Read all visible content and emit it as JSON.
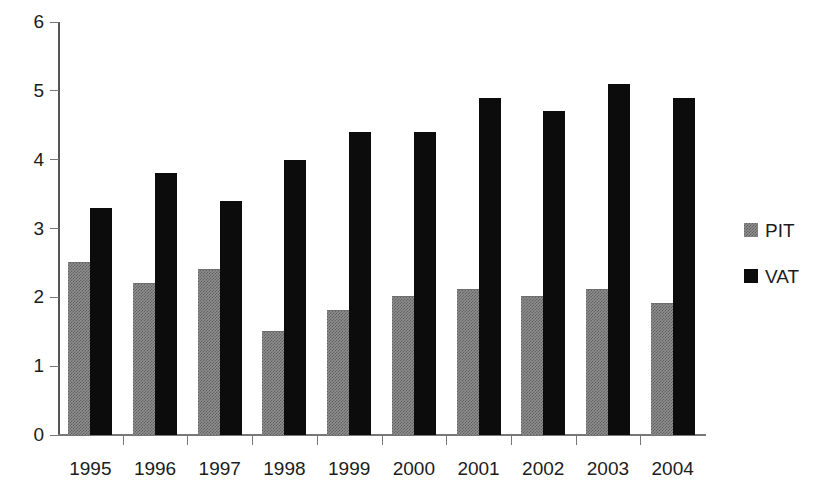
{
  "chart_data": {
    "type": "bar",
    "title": "",
    "subtitle": "",
    "xlabel": "",
    "ylabel": "",
    "categories": [
      "1995",
      "1996",
      "1997",
      "1998",
      "1999",
      "2000",
      "2001",
      "2002",
      "2003",
      "2004"
    ],
    "series": [
      {
        "name": "PIT",
        "color": "#8d8d8d",
        "values": [
          2.5,
          2.2,
          2.4,
          1.5,
          1.8,
          2.0,
          2.1,
          2.0,
          2.1,
          1.9
        ]
      },
      {
        "name": "VAT",
        "color": "#0c0c0c",
        "values": [
          3.3,
          3.8,
          3.4,
          4.0,
          4.4,
          4.4,
          4.9,
          4.7,
          5.1,
          4.9
        ]
      }
    ],
    "ylim": [
      0,
      6
    ],
    "yticks": [
      0,
      1,
      2,
      3,
      4,
      5,
      6
    ],
    "ytick_labels": [
      "0",
      "1",
      "2",
      "3",
      "4",
      "5",
      "6"
    ],
    "grid": false,
    "legend_position": "right"
  },
  "legend": {
    "entries": [
      {
        "label": "PIT",
        "swatch": "pit-swatch"
      },
      {
        "label": "VAT",
        "swatch": "vat-swatch"
      }
    ]
  }
}
